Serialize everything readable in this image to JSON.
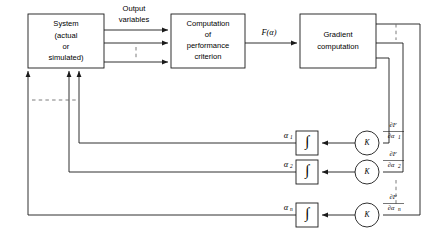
{
  "diagram": {
    "line_color": "#1a1a1a",
    "dash_color": "#6e6e6e",
    "background": "#ffffff"
  },
  "blocks": {
    "system": {
      "name": "system-block",
      "lines": [
        "System",
        "(actual",
        "or",
        "simulated)"
      ],
      "x": 28,
      "y": 14,
      "w": 76,
      "h": 54
    },
    "performance": {
      "name": "performance-criterion-block",
      "lines": [
        "Computation",
        "of",
        "performance",
        "criterion"
      ],
      "x": 171,
      "y": 14,
      "w": 74,
      "h": 54
    },
    "gradient": {
      "name": "gradient-computation-block",
      "lines": [
        "Gradient",
        "computation"
      ],
      "x": 300,
      "y": 14,
      "w": 76,
      "h": 54
    }
  },
  "labels": {
    "output_variables": [
      "Output",
      "variables"
    ],
    "f_alpha": "F(α)",
    "gain_symbol": "K",
    "integrator_symbol": "∫"
  },
  "channels": [
    {
      "index": 1,
      "alpha_base": "α",
      "alpha_sub": "1",
      "grad_num": "∂F",
      "grad_den_base": "∂α",
      "grad_den_sub": "1",
      "row_y": 143
    },
    {
      "index": 2,
      "alpha_base": "α",
      "alpha_sub": "2",
      "grad_num": "∂F",
      "grad_den_base": "∂α",
      "grad_den_sub": "2",
      "row_y": 172
    },
    {
      "index": 3,
      "alpha_base": "α",
      "alpha_sub": "n",
      "grad_num": "∂F",
      "grad_den_base": "∂α",
      "grad_den_sub": "n",
      "row_y": 215
    }
  ]
}
